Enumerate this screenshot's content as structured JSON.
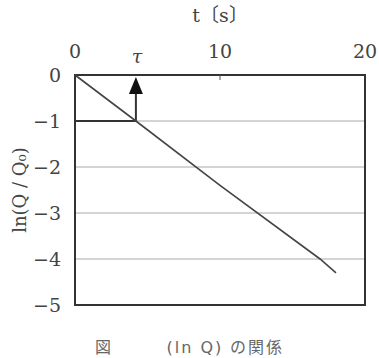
{
  "chart_data": {
    "type": "line",
    "title": "",
    "xlabel": "t〔s〕",
    "ylabel": "ln(Q / Q₀)",
    "xlim": [
      0,
      20
    ],
    "ylim": [
      -5,
      0
    ],
    "x_axis_position": "top",
    "x_ticks": [
      {
        "value": 0,
        "label": "0"
      },
      {
        "value": 10,
        "label": "10"
      },
      {
        "value": 20,
        "label": "20"
      }
    ],
    "y_ticks": [
      {
        "value": 0,
        "label": "0"
      },
      {
        "value": -1,
        "label": "−1"
      },
      {
        "value": -2,
        "label": "−2"
      },
      {
        "value": -3,
        "label": "−3"
      },
      {
        "value": -4,
        "label": "−4"
      },
      {
        "value": -5,
        "label": "−5"
      }
    ],
    "grid": {
      "horizontal": true,
      "vertical": false
    },
    "series": [
      {
        "name": "ln(Q/Q0)",
        "x": [
          0,
          4.2,
          10,
          16.9,
          18.0
        ],
        "y": [
          0,
          -1.0,
          -2.4,
          -4.0,
          -4.3
        ]
      }
    ],
    "annotations": [
      {
        "type": "arrow",
        "label": "τ",
        "x": 4.2,
        "from_y": -1,
        "to_y": 0,
        "note": "time constant where ln(Q/Q0) = −1"
      },
      {
        "type": "hline",
        "y": -1,
        "from_x": 0,
        "to_x": 4.2,
        "bold": true
      }
    ],
    "caption_partial": "図 … (ln Q) … 関係"
  },
  "labels": {
    "x_axis_title": "t〔s〕",
    "tau": "τ",
    "y_axis_title": "ln(Q / Q₀)",
    "caption": "図　　　(ln Q) の関係"
  },
  "colors": {
    "axis": "#333333",
    "grid": "#aaaaaa",
    "line": "#444444",
    "text": "#444444"
  }
}
